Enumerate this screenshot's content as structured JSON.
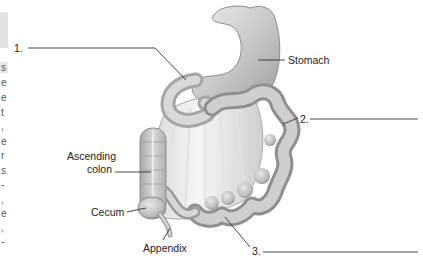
{
  "diagram": {
    "labels": {
      "stomach": "Stomach",
      "ascending_colon_line1": "Ascending",
      "ascending_colon_line2": "colon",
      "cecum": "Cecum",
      "appendix": "Appendix"
    },
    "blanks": [
      {
        "number": "1.",
        "answer": ""
      },
      {
        "number": "2.",
        "answer": ""
      },
      {
        "number": "3.",
        "answer": ""
      }
    ],
    "edge_text_fragments": [
      "s",
      "e",
      "e",
      "t",
      ",",
      "e",
      "r",
      "s",
      "-",
      ",",
      "e",
      ",",
      "-"
    ],
    "colors": {
      "organ_fill": "#c8c8c8",
      "organ_shadow": "#9a9a9a",
      "organ_highlight": "#ececec",
      "leader_line": "#333333",
      "text": "#222222"
    }
  }
}
